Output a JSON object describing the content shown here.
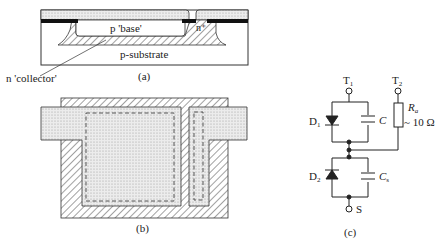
{
  "figure_a": {
    "caption": "(a)",
    "labels": {
      "base": "p 'base'",
      "emitter": "n⁺",
      "substrate": "p-substrate",
      "collector": "n 'collector'"
    }
  },
  "figure_b": {
    "caption": "(b)"
  },
  "figure_c": {
    "caption": "(c)",
    "terminals": {
      "t1": "T",
      "t1_sub": "1",
      "t2": "T",
      "t2_sub": "2",
      "s": "S"
    },
    "components": {
      "d1": "D",
      "d1_sub": "1",
      "c": "C",
      "d2": "D",
      "d2_sub": "2",
      "cs": "C",
      "cs_sub": "s",
      "r": "R",
      "r_sub": "a",
      "r_value": "~ 10 Ω"
    }
  },
  "colors": {
    "ink": "#222222",
    "dot_fill": "#e6e6e6",
    "hatch": "#444444"
  }
}
